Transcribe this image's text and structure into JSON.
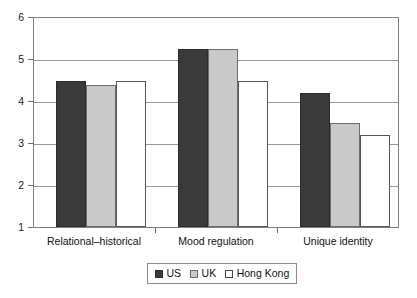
{
  "chart_data": {
    "type": "bar",
    "title": "",
    "subtitle": "",
    "xlabel": "",
    "ylabel": "",
    "categories": [
      "Relational–historical",
      "Mood regulation",
      "Unique identity"
    ],
    "series": [
      {
        "name": "US",
        "color": "#3a3a3a",
        "values": [
          4.5,
          5.25,
          4.2
        ]
      },
      {
        "name": "UK",
        "color": "#c9c9c9",
        "values": [
          4.4,
          5.25,
          3.5
        ]
      },
      {
        "name": "Hong Kong",
        "color": "#ffffff",
        "values": [
          4.5,
          4.5,
          3.2
        ]
      }
    ],
    "ylim": [
      1,
      6
    ],
    "yticks": [
      1,
      2,
      3,
      4,
      5,
      6
    ],
    "ytick_labels": [
      "1",
      "2",
      "3",
      "4",
      "5",
      "6"
    ],
    "grid": true,
    "grid_axis": "y",
    "legend_position": "bottom-center",
    "legend_entries": [
      "US",
      "UK",
      "Hong Kong"
    ]
  },
  "axis": {
    "y_tick_labels": [
      "6",
      "5",
      "4",
      "3",
      "2",
      "1"
    ]
  },
  "legend": {
    "items": [
      {
        "label": "US"
      },
      {
        "label": "UK"
      },
      {
        "label": "Hong Kong"
      }
    ]
  }
}
